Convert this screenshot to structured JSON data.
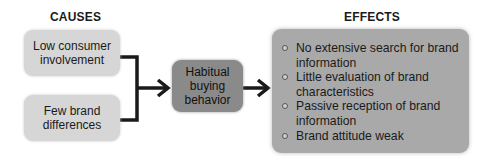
{
  "headings": {
    "causes": "CAUSES",
    "effects": "EFFECTS"
  },
  "causes": [
    {
      "label": "Low consumer involvement"
    },
    {
      "label": "Few brand differences"
    }
  ],
  "center": {
    "label": "Habitual buying behavior"
  },
  "effects": [
    "No extensive search for brand information",
    "Little evaluation of brand characteristics",
    "Passive reception of brand information",
    "Brand attitude weak"
  ],
  "colors": {
    "cause_box": "#d6d6d6",
    "center_box": "#8a8a8a",
    "effects_box": "#a9a9a9",
    "connector": "#1a1a1a"
  }
}
